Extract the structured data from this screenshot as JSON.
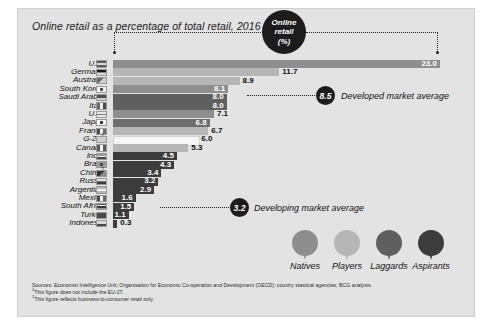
{
  "title": "Online retail as a percentage of total retail, 2016",
  "colors": {
    "panel_bg": "#e3e3e3",
    "natives": "#8e8e8e",
    "players": "#b6b6b6",
    "laggards": "#5f5f5f",
    "aspirants": "#3c3c3c",
    "g20": "#f6f6f6",
    "bubble": "#1c1c1c"
  },
  "callout": {
    "bubble_line1": "Online",
    "bubble_line2": "retail",
    "bubble_line3": "(%)"
  },
  "averages": [
    {
      "id": "developed",
      "value": "8.5",
      "label": "Developed market average"
    },
    {
      "id": "developing",
      "value": "3.2",
      "label": "Developing market average"
    }
  ],
  "legend": {
    "items": [
      {
        "label": "Natives",
        "color": "#8e8e8e"
      },
      {
        "label": "Players",
        "color": "#b6b6b6"
      },
      {
        "label": "Laggards",
        "color": "#5f5f5f"
      },
      {
        "label": "Aspirants",
        "color": "#3c3c3c"
      }
    ]
  },
  "notes": [
    "Sources: Economist Intelligence Unit; Organisation for Economic Co-operation and Development (OECD); country stastical agencies; BCG analysis.",
    "1This figure does not include the EU-27.",
    "2This figure reflects business-to-consumer retail only."
  ],
  "chart_data": {
    "type": "bar",
    "title": "Online retail as a percentage of total retail, 2016",
    "xlabel": "Online retail (%)",
    "ylabel": "",
    "xlim": [
      0,
      23.0
    ],
    "grid": false,
    "legend_position": "bottom-right",
    "orientation": "horizontal",
    "categories": [
      "U.K.",
      "Germany",
      "Australia",
      "South Korea",
      "Saudi Arabia",
      "Italy",
      "U.S.",
      "Japan",
      "France",
      "G-20",
      "Canada",
      "India",
      "Brazil",
      "China",
      "Russia",
      "Argentina",
      "Mexico",
      "South Africa",
      "Turkey",
      "Indonesia"
    ],
    "values": [
      23.0,
      11.7,
      8.9,
      8.1,
      8.0,
      8.0,
      7.1,
      6.8,
      6.7,
      6.0,
      5.3,
      4.5,
      4.3,
      3.4,
      3.2,
      2.9,
      1.6,
      1.5,
      1.1,
      0.3
    ],
    "value_labels": [
      "23.0",
      "11.7",
      "8.9",
      "8.1",
      "8.0",
      "8.0",
      "7.1",
      "6.8",
      "6.7",
      "6.0",
      "5.3",
      "4.5",
      "4.3",
      "3.4",
      "3.2",
      "2.9",
      "1.6",
      "1.5",
      "1.1",
      "0.3"
    ],
    "footnote_marks": [
      "",
      "",
      "",
      "",
      "",
      "",
      "",
      "",
      "",
      "1",
      "",
      "",
      "",
      "2",
      "",
      "",
      "",
      "",
      "",
      ""
    ],
    "segment": [
      "natives",
      "players",
      "players",
      "natives",
      "laggards",
      "laggards",
      "natives",
      "laggards",
      "players",
      "g20",
      "players",
      "aspirants",
      "aspirants",
      "aspirants",
      "aspirants",
      "aspirants",
      "aspirants",
      "aspirants",
      "aspirants",
      "aspirants"
    ],
    "bar_colors": [
      "#8e8e8e",
      "#b6b6b6",
      "#b6b6b6",
      "#8e8e8e",
      "#5f5f5f",
      "#5f5f5f",
      "#8e8e8e",
      "#6e6e6e",
      "#b6b6b6",
      "#f6f6f6",
      "#b6b6b6",
      "#3c3c3c",
      "#3c3c3c",
      "#3c3c3c",
      "#3c3c3c",
      "#3c3c3c",
      "#3c3c3c",
      "#3c3c3c",
      "#3c3c3c",
      "#3c3c3c"
    ],
    "label_inside": [
      true,
      false,
      false,
      true,
      true,
      true,
      false,
      true,
      false,
      false,
      false,
      true,
      true,
      true,
      true,
      true,
      true,
      true,
      true,
      false
    ],
    "annotations": [
      {
        "text": "8.5",
        "label": "Developed market average"
      },
      {
        "text": "3.2",
        "label": "Developing market average"
      }
    ]
  }
}
